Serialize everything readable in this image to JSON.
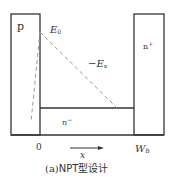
{
  "diagram": {
    "title": "NPT型设计",
    "caption": "(a)NPT型设计",
    "caption_prefix": "(a)",
    "caption_text": "NPT型设计",
    "regions": {
      "p": "p",
      "n_plus": "n+",
      "n_minus": "n⁻"
    },
    "labels": {
      "E0_base": "E",
      "E0_sub": "0",
      "Ex_prefix": "−",
      "Ex_base": "E",
      "Ex_sub": "x",
      "origin": "0",
      "WB_base": "W",
      "WB_sub": "B",
      "x_axis": "x",
      "n_minus_base": "n",
      "n_minus_sup": "−",
      "n_plus_base": "n",
      "n_plus_sup": "+"
    },
    "colors": {
      "stroke": "#333333",
      "dashed": "#999999",
      "background": "#ffffff"
    },
    "geometry": {
      "p_box": {
        "x1": 11,
        "y1": 14,
        "x2": 40,
        "y2": 135
      },
      "n_plus_box": {
        "x1": 134,
        "y1": 14,
        "x2": 164,
        "y2": 135
      },
      "n_minus_top_y": 108,
      "baseline_y": 135,
      "field_peak": {
        "x": 40,
        "y": 32
      },
      "field_end_npt": {
        "x": 117,
        "y": 108
      },
      "field_end_pt": {
        "x": 31,
        "y": 122
      },
      "x_arrow": {
        "x1": 70,
        "x2": 103,
        "y": 148
      }
    }
  }
}
